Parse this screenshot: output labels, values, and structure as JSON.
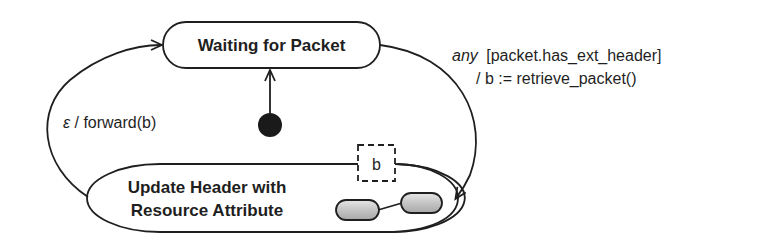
{
  "diagram": {
    "type": "uml-state-machine",
    "states": [
      {
        "id": "waiting",
        "label_lines": [
          "Waiting for Packet"
        ]
      },
      {
        "id": "update",
        "label_lines": [
          "Update Header with",
          "Resource Attribute"
        ]
      }
    ],
    "initial_node": {
      "target": "waiting"
    },
    "pin": {
      "label": "b"
    },
    "transitions": [
      {
        "from": "waiting",
        "to": "update",
        "trigger": "any",
        "guard": "[packet.has_ext_header]",
        "effect": "/ b := retrieve_packet()"
      },
      {
        "from": "update",
        "to": "waiting",
        "trigger": "ε",
        "effect": " / forward(b)"
      }
    ],
    "composite_icon": "two-linked-capsules",
    "colors": {
      "stroke": "#1f1f1f",
      "capsule_fill": "#c9c9c9",
      "background": "#ffffff"
    }
  }
}
